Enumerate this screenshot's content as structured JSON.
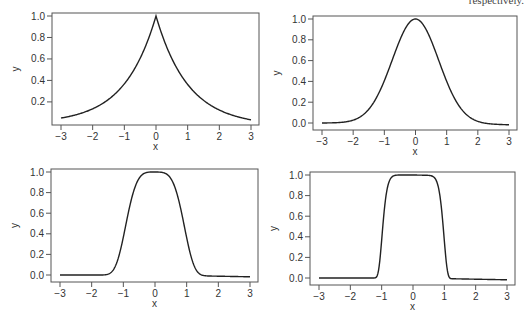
{
  "caption_fragment": "respectively.",
  "chart_data": [
    {
      "type": "line",
      "title": "",
      "xlabel": "x",
      "ylabel": "y",
      "xlim": [
        -3,
        3
      ],
      "ylim": [
        0.05,
        1.0
      ],
      "xticks": [
        -3,
        -2,
        -1,
        0,
        1,
        2,
        3
      ],
      "xtick_labels": [
        "−3",
        "−2",
        "−1",
        "0",
        "1",
        "2",
        "3"
      ],
      "yticks": [
        0.2,
        0.4,
        0.6,
        0.8,
        1.0
      ],
      "ytick_labels": [
        "0.2",
        "0.4",
        "0.6",
        "0.8",
        "1.0"
      ],
      "grid": false,
      "series": [
        {
          "name": "exp(-|x|)",
          "x": [
            -3,
            -2,
            -1,
            -0.5,
            0,
            0.5,
            1,
            2,
            3
          ],
          "values": [
            0.05,
            0.14,
            0.37,
            0.61,
            1.0,
            0.61,
            0.37,
            0.14,
            0.05
          ]
        }
      ],
      "shape_exponent": 1
    },
    {
      "type": "line",
      "title": "",
      "xlabel": "x",
      "ylabel": "y",
      "xlim": [
        -3,
        3
      ],
      "ylim": [
        0.0,
        1.0
      ],
      "xticks": [
        -3,
        -2,
        -1,
        0,
        1,
        2,
        3
      ],
      "xtick_labels": [
        "−3",
        "−2",
        "−1",
        "0",
        "1",
        "2",
        "3"
      ],
      "yticks": [
        0.0,
        0.2,
        0.4,
        0.6,
        0.8,
        1.0
      ],
      "ytick_labels": [
        "0.0",
        "0.2",
        "0.4",
        "0.6",
        "0.8",
        "1.0"
      ],
      "grid": false,
      "series": [
        {
          "name": "exp(-x^2)",
          "x": [
            -3,
            -2,
            -1,
            -0.5,
            0,
            0.5,
            1,
            2,
            3
          ],
          "values": [
            0.0,
            0.02,
            0.37,
            0.78,
            1.0,
            0.78,
            0.37,
            0.02,
            0.0
          ]
        }
      ],
      "shape_exponent": 2
    },
    {
      "type": "line",
      "title": "",
      "xlabel": "x",
      "ylabel": "y",
      "xlim": [
        -3,
        3
      ],
      "ylim": [
        0.0,
        1.0
      ],
      "xticks": [
        -3,
        -2,
        -1,
        0,
        1,
        2,
        3
      ],
      "xtick_labels": [
        "−3",
        "−2",
        "−1",
        "0",
        "1",
        "2",
        "3"
      ],
      "yticks": [
        0.0,
        0.2,
        0.4,
        0.6,
        0.8,
        1.0
      ],
      "ytick_labels": [
        "0.0",
        "0.2",
        "0.4",
        "0.6",
        "0.8",
        "1.0"
      ],
      "grid": false,
      "series": [
        {
          "name": "exp(-x^4)",
          "x": [
            -3,
            -2,
            -1.5,
            -1,
            -0.5,
            0,
            0.5,
            1,
            1.5,
            2,
            3
          ],
          "values": [
            0.0,
            0.0,
            0.01,
            0.37,
            0.94,
            1.0,
            0.94,
            0.37,
            0.01,
            0.0,
            0.0
          ]
        }
      ],
      "shape_exponent": 4
    },
    {
      "type": "line",
      "title": "",
      "xlabel": "x",
      "ylabel": "y",
      "xlim": [
        -3,
        3
      ],
      "ylim": [
        0.0,
        1.0
      ],
      "xticks": [
        -3,
        -2,
        -1,
        0,
        1,
        2,
        3
      ],
      "xtick_labels": [
        "−3",
        "−2",
        "−1",
        "0",
        "1",
        "2",
        "3"
      ],
      "yticks": [
        0.0,
        0.2,
        0.4,
        0.6,
        0.8,
        1.0
      ],
      "ytick_labels": [
        "0.0",
        "0.2",
        "0.4",
        "0.6",
        "0.8",
        "1.0"
      ],
      "grid": false,
      "series": [
        {
          "name": "exp(-|x|^10)",
          "x": [
            -3,
            -2,
            -1.2,
            -1,
            -0.8,
            0,
            0.8,
            1,
            1.2,
            2,
            3
          ],
          "values": [
            0.0,
            0.0,
            0.0,
            0.37,
            0.9,
            1.0,
            0.9,
            0.37,
            0.0,
            0.0,
            0.0
          ]
        }
      ],
      "shape_exponent": 10
    }
  ],
  "panels": [
    {
      "frame": [
        52,
        13,
        259,
        125
      ]
    },
    {
      "frame": [
        313,
        16,
        517,
        130
      ]
    },
    {
      "frame": [
        51,
        169,
        258,
        282
      ]
    },
    {
      "frame": [
        310,
        172,
        515,
        285
      ]
    }
  ]
}
